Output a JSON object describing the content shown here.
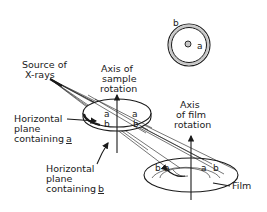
{
  "diagram": {
    "type": "x-ray rotation camera schematic",
    "inset": {
      "outer_ring_label": "b",
      "inner_spot_label": "a",
      "ring_fill": "#c8c8c8",
      "spot_fill": "#c8c8c8"
    },
    "labels": {
      "source_line1": "Source of",
      "source_line2": "X-rays",
      "sample_axis_line1": "Axis of",
      "sample_axis_line2": "sample",
      "sample_axis_line3": "rotation",
      "film_axis_line1": "Axis",
      "film_axis_line2": "of film",
      "film_axis_line3": "rotation",
      "plane_a_line1": "Horizontal",
      "plane_a_line2": "plane",
      "plane_a_line3": "containing",
      "plane_a_letter": "a",
      "plane_b_line1": "Horizontal",
      "plane_b_line2": "plane",
      "plane_b_line3": "containing",
      "plane_b_letter": "b",
      "film": "Film"
    },
    "sample_points": [
      "a",
      "b",
      "a",
      "b"
    ],
    "film_points": [
      "b",
      "a",
      "a",
      "b"
    ],
    "line_color": "#1a1a1a",
    "background": "#ffffff"
  }
}
